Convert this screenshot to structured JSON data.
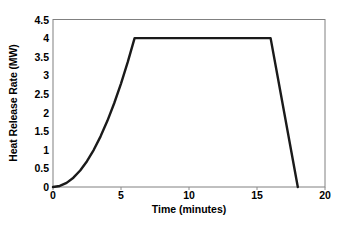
{
  "chart_data": {
    "type": "line",
    "title": "",
    "subtitle": "",
    "xlabel": "Time (minutes)",
    "ylabel": "Heat Release Rate (MW)",
    "xlim": [
      0,
      20
    ],
    "ylim": [
      0,
      4.5
    ],
    "xticks": [
      "0",
      "5",
      "10",
      "15",
      "20"
    ],
    "xtick_values": [
      0,
      5,
      10,
      15,
      20
    ],
    "yticks": [
      "0",
      "0.5",
      "1",
      "1.5",
      "2",
      "2.5",
      "3",
      "3.5",
      "4",
      "4.5"
    ],
    "ytick_values": [
      0,
      0.5,
      1,
      1.5,
      2,
      2.5,
      3,
      3.5,
      4,
      4.5
    ],
    "grid": false,
    "legend": null,
    "legend_position": "none",
    "line_color": "#1a1a1a",
    "line_width": 2.4,
    "axis_color": "#808080",
    "series": [
      {
        "name": "Design fire heat release rate",
        "x": [
          0,
          0.5,
          1,
          1.5,
          2,
          2.5,
          3,
          3.5,
          4,
          4.5,
          5,
          5.5,
          6,
          7,
          8,
          9,
          10,
          11,
          12,
          13,
          14,
          15,
          16,
          16.5,
          17,
          17.5,
          18
        ],
        "y": [
          0,
          0.028,
          0.111,
          0.25,
          0.444,
          0.694,
          1.0,
          1.361,
          1.778,
          2.25,
          2.778,
          3.361,
          4.0,
          4.0,
          4.0,
          4.0,
          4.0,
          4.0,
          4.0,
          4.0,
          4.0,
          4.0,
          4.0,
          3.0,
          2.0,
          1.0,
          0
        ]
      }
    ],
    "annotations": []
  }
}
